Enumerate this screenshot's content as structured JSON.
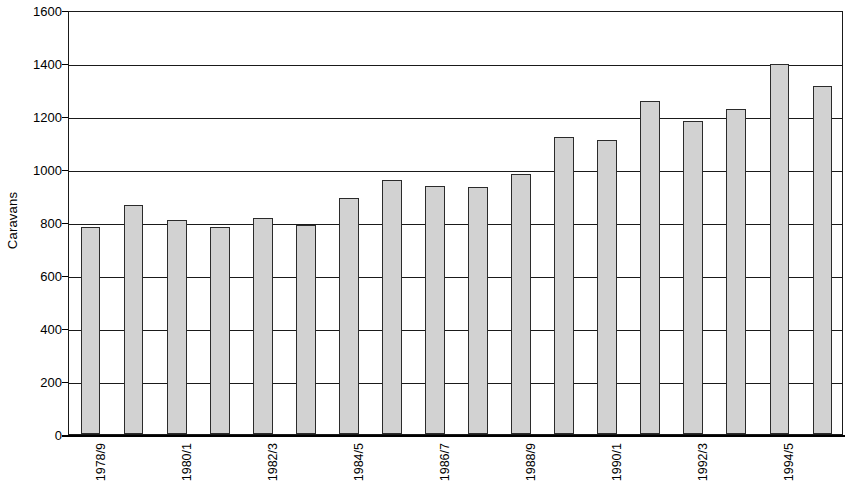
{
  "chart_data": {
    "type": "bar",
    "title": "",
    "xlabel": "",
    "ylabel": "Caravans",
    "ylim": [
      0,
      1600
    ],
    "ytick_step": 200,
    "yticks": [
      0,
      200,
      400,
      600,
      800,
      1000,
      1200,
      1400,
      1600
    ],
    "ytick_labels": [
      "0",
      "200",
      "400",
      "600",
      "800",
      "1000",
      "1200",
      "1400",
      "1600"
    ],
    "grid": true,
    "grid_axis": "y",
    "legend": false,
    "legend_position": "none",
    "bar_fill_color": "#d2d2d2",
    "bar_edge_color": "#2b2b2b",
    "axis_color": "#1a1a1a",
    "background_color": "#ffffff",
    "categories": [
      "1978/9",
      "1979/80",
      "1980/1",
      "1981/2",
      "1982/3",
      "1983/4",
      "1984/5",
      "1985/6",
      "1986/7",
      "1987/8",
      "1988/9",
      "1989/90",
      "1990/1",
      "1991/2",
      "1992/3",
      "1993/4",
      "1994/5",
      "1995/6"
    ],
    "visible_xtick_labels": [
      "1978/9",
      "1980/1",
      "1982/3",
      "1984/5",
      "1986/7",
      "1988/9",
      "1990/1",
      "1992/3",
      "1994/5"
    ],
    "xtick_label_interval": 2,
    "xtick_label_rotation": 90,
    "values": [
      780,
      865,
      808,
      780,
      815,
      790,
      890,
      960,
      935,
      932,
      982,
      1120,
      1110,
      1258,
      1182,
      1225,
      1395,
      1315
    ]
  }
}
